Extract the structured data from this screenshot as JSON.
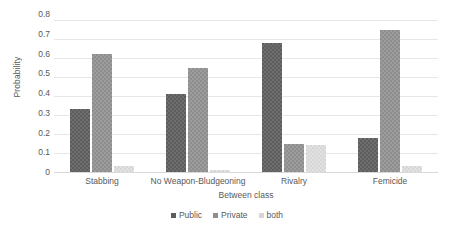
{
  "chart_data": {
    "type": "bar",
    "title": "",
    "xlabel": "Between class",
    "ylabel": "Probability",
    "ylim": [
      0,
      0.8
    ],
    "yticks": [
      "0",
      "0.1",
      "0.2",
      "0.3",
      "0.4",
      "0.5",
      "0.6",
      "0.7",
      "0.8"
    ],
    "ytick_values": [
      0,
      0.1,
      0.2,
      0.3,
      0.4,
      0.5,
      0.6,
      0.7,
      0.8
    ],
    "grid": true,
    "legend_position": "bottom",
    "categories": [
      "Stabbing",
      "No Weapon-Bludgeoning",
      "Rivalry",
      "Femicide"
    ],
    "series": [
      {
        "name": "Public",
        "color": "#5d5d5d",
        "values": [
          0.33,
          0.41,
          0.68,
          0.18
        ]
      },
      {
        "name": "Private",
        "color": "#8e8e8e",
        "values": [
          0.62,
          0.55,
          0.15,
          0.745
        ]
      },
      {
        "name": "both",
        "color": "#d6d6d6",
        "values": [
          0.03,
          0.01,
          0.14,
          0.03
        ]
      }
    ]
  }
}
